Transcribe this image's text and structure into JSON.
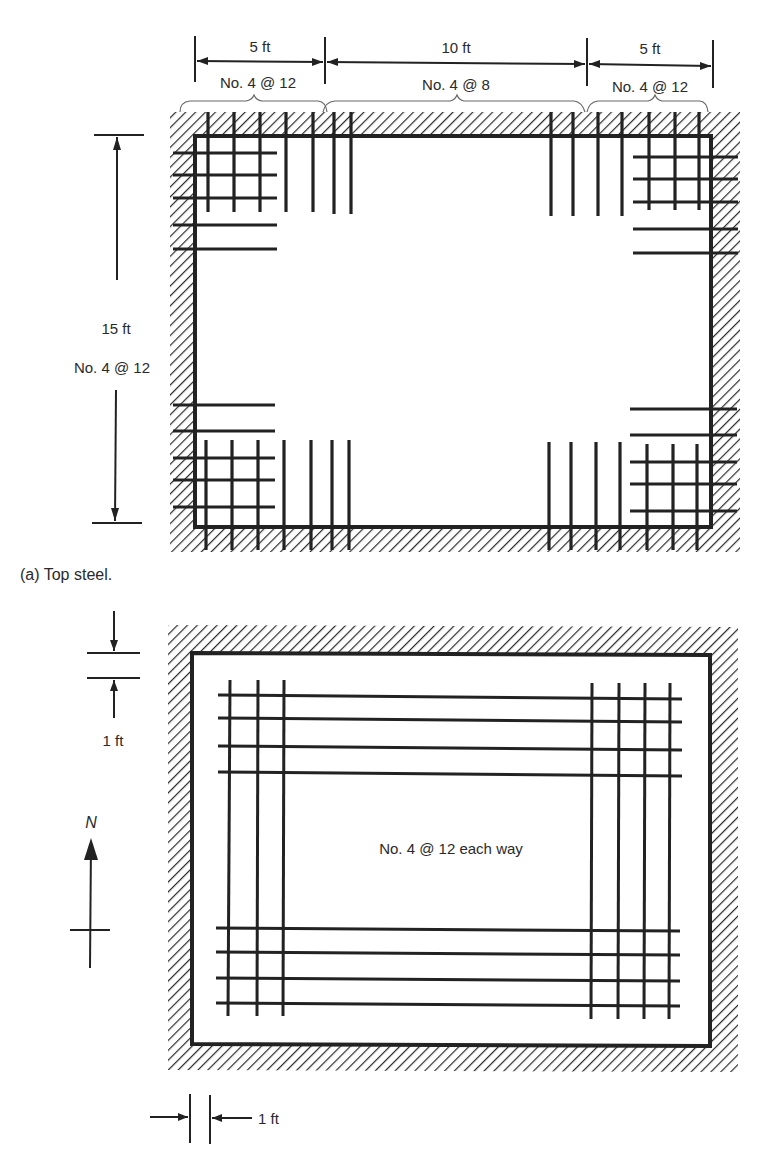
{
  "figure": {
    "colors": {
      "ink": "#222222",
      "paper": "#ffffff",
      "hatch": "#2a2a2a"
    },
    "top_steel": {
      "caption": "(a)  Top steel.",
      "dims_horizontal": [
        {
          "length": "5 ft",
          "bars": "No. 4  @  12"
        },
        {
          "length": "10 ft",
          "bars": "No. 4  @  8"
        },
        {
          "length": "5 ft",
          "bars": "No. 4  @  12"
        }
      ],
      "dim_vertical": {
        "length": "15 ft",
        "bars": "No. 4  @  12"
      }
    },
    "bottom_steel": {
      "label": "No. 4  @  12 each way",
      "edge_offset_vertical": "1 ft",
      "edge_offset_horizontal": "1 ft",
      "north_label": "N"
    }
  }
}
